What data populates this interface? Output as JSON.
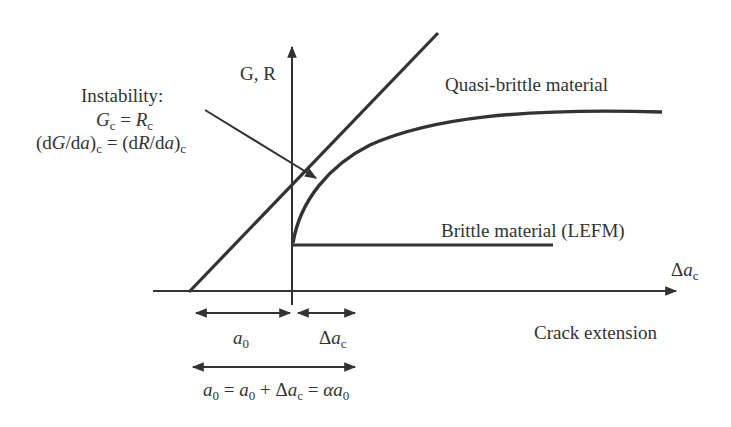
{
  "diagram": {
    "type": "R-curve diagram",
    "y_axis_label": "G, R",
    "x_axis_label": "Crack extension",
    "x_axis_end_label": {
      "delta": "Δ",
      "var": "a",
      "sub": "c"
    },
    "instability": {
      "title": "Instability:",
      "eq1": {
        "lhs": "G",
        "lhs_sub": "c",
        "eq": " = ",
        "rhs": "R",
        "rhs_sub": "c"
      },
      "eq2": {
        "text_a": "(d",
        "G": "G",
        "slash": "/d",
        "a": "a",
        "close": ")",
        "sub": "c",
        "eq": " = (d",
        "R": "R",
        "slash2": "/d",
        "a2": "a",
        "close2": ")",
        "sub2": "c"
      }
    },
    "curves": [
      {
        "name": "Quasi-brittle material"
      },
      {
        "name": "Brittle material (LEFM)"
      }
    ],
    "dimensions": {
      "a0": {
        "var": "a",
        "sub": "0"
      },
      "delta_ac": {
        "delta": "Δ",
        "var": "a",
        "sub": "c"
      },
      "equation": {
        "p1": "a",
        "s1": "0",
        "eq1": " = ",
        "p2": "a",
        "s2": "0",
        "plus": " + Δ",
        "p3": "a",
        "s3": "c",
        "eq2": " = ",
        "alpha": "α",
        "p4": "a",
        "s4": "0"
      }
    },
    "colors": {
      "line": "#333333",
      "background": "#ffffff"
    }
  }
}
